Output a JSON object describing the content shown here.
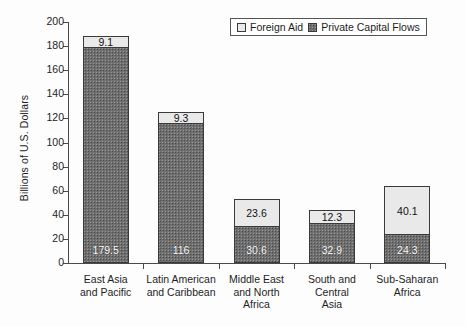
{
  "chart_data": {
    "type": "bar",
    "subtype": "stacked-bar",
    "title": "",
    "xlabel": "",
    "ylabel": "Billions of U.S. Dollars",
    "ylim": [
      0,
      200
    ],
    "ytick_step": 20,
    "yticks": [
      0,
      20,
      40,
      60,
      80,
      100,
      120,
      140,
      160,
      180,
      200
    ],
    "ytick_labels": [
      "0",
      "20",
      "40",
      "60",
      "80",
      "100",
      "120",
      "140",
      "160",
      "180",
      "200"
    ],
    "grid": false,
    "legend_position": "top-right",
    "categories": [
      "East Asia and Pacific",
      "Latin American and Caribbean",
      "Middle East and North Africa",
      "South and Central Asia",
      "Sub-Saharan Africa"
    ],
    "category_label_lines": [
      [
        "East Asia",
        "and Pacific"
      ],
      [
        "Latin American",
        "and Caribbean"
      ],
      [
        "Middle East",
        "and North",
        "Africa"
      ],
      [
        "South and",
        "Central",
        "Asia"
      ],
      [
        "Sub-Saharan",
        "Africa"
      ]
    ],
    "series": [
      {
        "name": "Private Capital Flows",
        "color": "#6f6f6f",
        "values": [
          179.5,
          116,
          30.6,
          32.9,
          24.3
        ],
        "value_labels": [
          "179.5",
          "116",
          "30.6",
          "32.9",
          "24.3"
        ]
      },
      {
        "name": "Foreign Aid",
        "color": "#e9e9e9",
        "values": [
          9.1,
          9.3,
          23.6,
          12.3,
          40.1
        ],
        "value_labels": [
          "9.1",
          "9.3",
          "23.6",
          "12.3",
          "40.1"
        ]
      }
    ],
    "totals": [
      188.6,
      125.3,
      54.2,
      45.2,
      64.4
    ]
  },
  "legend": {
    "entries": [
      {
        "label": "Foreign Aid",
        "swatch": "#e9e9e9"
      },
      {
        "label": "Private Capital Flows",
        "swatch": "#6f6f6f"
      }
    ]
  }
}
